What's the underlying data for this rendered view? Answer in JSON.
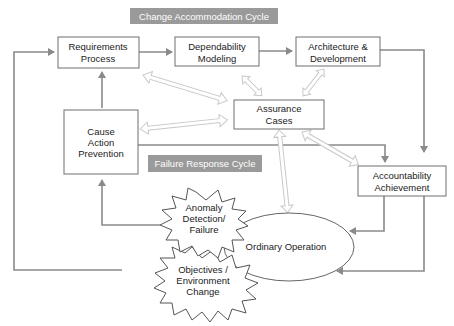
{
  "banners": {
    "change": "Change Accommodation Cycle",
    "failure": "Failure Response Cycle"
  },
  "nodes": {
    "requirements": [
      "Requirements",
      "Process"
    ],
    "dependability": [
      "Dependability",
      "Modeling"
    ],
    "architecture": [
      "Architecture &",
      "Development"
    ],
    "assurance": [
      "Assurance",
      "Cases"
    ],
    "cause": [
      "Cause",
      "Action",
      "Prevention"
    ],
    "accountability": [
      "Accountability",
      "Achievement"
    ],
    "anomaly": [
      "Anomaly",
      "Detection/",
      "Failure"
    ],
    "objectives": [
      "Objectives /",
      "Environment",
      "Change"
    ],
    "ordinary": "Ordinary Operation"
  },
  "colors": {
    "banner": "#9a9a9a",
    "connector": "#8a8a8a",
    "double_arrow": "#c9c9c9",
    "box_stroke": "#6e6e6e"
  }
}
